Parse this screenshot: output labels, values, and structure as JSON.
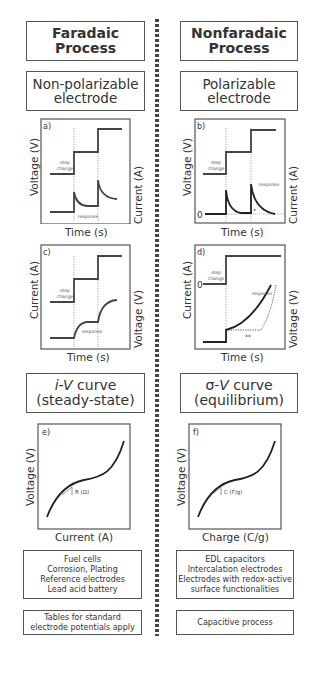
{
  "left": {
    "header": "Faradaic Process",
    "header_lines": [
      "Faradaic",
      "Process"
    ],
    "electrode_lines": [
      "Non-polarizable",
      "electrode"
    ],
    "plot_a": {
      "label": "a)",
      "ylabel_left": "Voltage (V)",
      "ylabel_right": "Current (A)",
      "xlabel": "Time (s)",
      "step_label": [
        "step",
        "change"
      ],
      "response_label": "response"
    },
    "plot_c": {
      "label": "c)",
      "ylabel_left": "Current (A)",
      "ylabel_right": "Voltage (V)",
      "xlabel": "Time (s)",
      "step_label": [
        "step",
        "change"
      ],
      "response_label": "response"
    },
    "curve_box": {
      "italic": "i-V",
      "rest": " curve",
      "line2": "(steady-state)"
    },
    "plot_e": {
      "label": "e)",
      "ylabel": "Voltage (V)",
      "xlabel": "Current (A)",
      "slope_label": "R (Ω)"
    },
    "examples": [
      "Fuel cells",
      "Corrosion, Plating",
      "Reference electrodes",
      "Lead acid battery"
    ],
    "note": [
      "Tables for standard",
      "electrode potentials apply"
    ]
  },
  "right": {
    "header_lines": [
      "Nonfaradaic",
      "Process"
    ],
    "electrode_lines": [
      "Polarizable",
      "electrode"
    ],
    "plot_b": {
      "label": "b)",
      "ylabel_left": "Voltage (V)",
      "ylabel_right": "Current (A)",
      "xlabel": "Time (s)",
      "step_label": [
        "step",
        "change"
      ],
      "response_label": "response",
      "zero": "0",
      "marker": "*"
    },
    "plot_d": {
      "label": "d)",
      "ylabel_left": "Current (A)",
      "ylabel_right": "Voltage (V)",
      "xlabel": "Time (s)",
      "step_label": [
        "step",
        "change"
      ],
      "response_label": "response",
      "zero": "0",
      "marker": "**"
    },
    "curve_box": {
      "italic": "V",
      "prefix": "σ-",
      "rest": " curve",
      "line2": "(equilibrium)"
    },
    "plot_f": {
      "label": "f)",
      "ylabel": "Voltage (V)",
      "xlabel": "Charge (C/g)",
      "slope_label": "C (F/g)"
    },
    "examples": [
      "EDL capacitors",
      "Intercalation electrodes",
      "Electrodes with redox-active",
      "surface functionalities"
    ],
    "note": [
      "Capacitive process"
    ]
  }
}
